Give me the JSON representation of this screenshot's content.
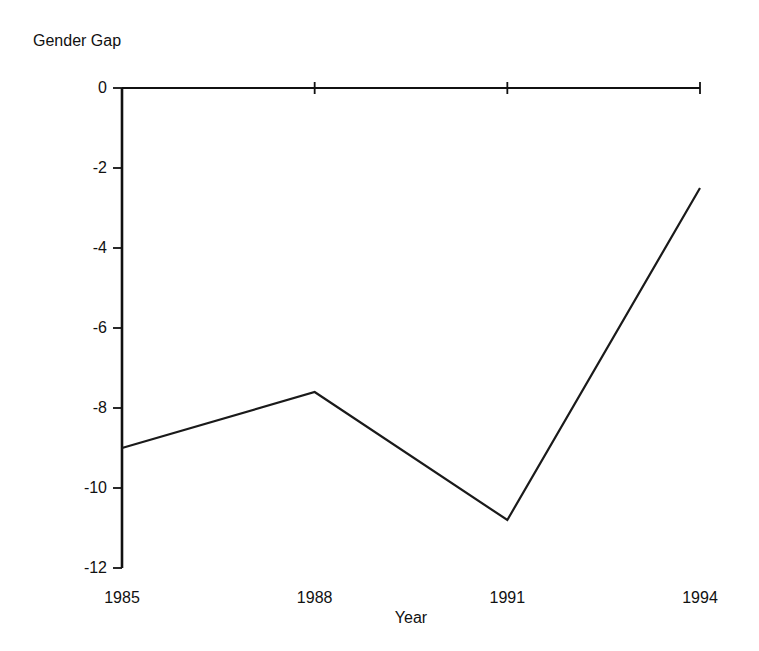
{
  "chart_data": {
    "type": "line",
    "title": "",
    "ylabel": "Gender Gap",
    "xlabel": "Year",
    "categories": [
      "1985",
      "1988",
      "1991",
      "1994"
    ],
    "x": [
      1985,
      1988,
      1991,
      1994
    ],
    "values": [
      -9.0,
      -7.6,
      -10.8,
      -2.5
    ],
    "series": [
      {
        "name": "Gender Gap",
        "values": [
          -9.0,
          -7.6,
          -10.8,
          -2.5
        ]
      }
    ],
    "ylim": [
      -12,
      0
    ],
    "xlim": [
      1985,
      1994
    ],
    "yticks": [
      0,
      -2,
      -4,
      -6,
      -8,
      -10,
      -12
    ],
    "ytick_labels": [
      "0",
      "-2",
      "-4",
      "-6",
      "-8",
      "-10",
      "-12"
    ],
    "xticks": [
      1985,
      1988,
      1991,
      1994
    ],
    "xtick_labels": [
      "1985",
      "1988",
      "1991",
      "1994"
    ],
    "grid": false,
    "legend": false,
    "legend_position": "none",
    "zero_reference_line": true,
    "annotations": []
  },
  "axes": {
    "y_axis_title": "Gender Gap",
    "x_axis_title": "Year"
  },
  "ticks": {
    "y": [
      {
        "label": "0",
        "value": 0
      },
      {
        "label": "-2",
        "value": -2
      },
      {
        "label": "-4",
        "value": -4
      },
      {
        "label": "-6",
        "value": -6
      },
      {
        "label": "-8",
        "value": -8
      },
      {
        "label": "-10",
        "value": -10
      },
      {
        "label": "-12",
        "value": -12
      }
    ],
    "x": [
      {
        "label": "1985",
        "value": 1985
      },
      {
        "label": "1988",
        "value": 1988
      },
      {
        "label": "1991",
        "value": 1991
      },
      {
        "label": "1994",
        "value": 1994
      }
    ]
  },
  "style": {
    "background": "#ffffff",
    "ink": "#111111",
    "line_color": "#1a1a1a"
  }
}
